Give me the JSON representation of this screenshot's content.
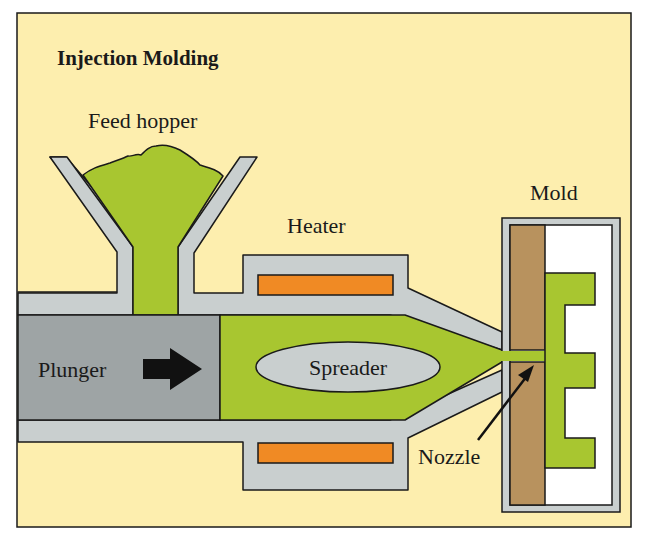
{
  "diagram": {
    "title": "Injection Molding",
    "labels": {
      "feed_hopper": "Feed hopper",
      "heater": "Heater",
      "mold": "Mold",
      "plunger": "Plunger",
      "spreader": "Spreader",
      "nozzle": "Nozzle"
    },
    "components": [
      {
        "id": "feed-hopper",
        "label": "Feed hopper"
      },
      {
        "id": "heater",
        "label": "Heater"
      },
      {
        "id": "plunger",
        "label": "Plunger"
      },
      {
        "id": "spreader",
        "label": "Spreader"
      },
      {
        "id": "nozzle",
        "label": "Nozzle"
      },
      {
        "id": "mold",
        "label": "Mold"
      }
    ],
    "arrows": [
      {
        "from": "plunger",
        "direction": "right",
        "meaning": "plunger push direction"
      },
      {
        "from": "nozzle-label",
        "to": "nozzle",
        "meaning": "pointer"
      }
    ],
    "colors": {
      "background": "#fdeeae",
      "frame_stroke": "#1a1a1a",
      "steel": "#c9cfcf",
      "plunger": "#9ea4a5",
      "plastic": "#a8c630",
      "heater_element": "#f08a24",
      "mold_plate": "#b8925e",
      "cavity": "#ffffff",
      "outline": "#1a1a1a"
    }
  }
}
